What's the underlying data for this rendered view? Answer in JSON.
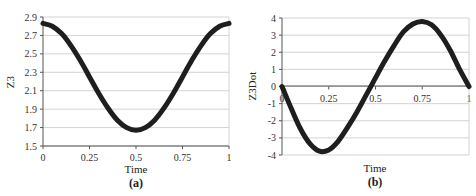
{
  "chart_data": [
    {
      "type": "line",
      "panel_label": "(a)",
      "title": "",
      "xlabel": "Time",
      "ylabel": "Z3",
      "xlim": [
        0,
        1
      ],
      "ylim": [
        1.5,
        2.9
      ],
      "x_ticks": [
        "0",
        "0.25",
        "0.5",
        "0.75",
        "1"
      ],
      "y_ticks": [
        "2.9",
        "2.7",
        "2.5",
        "2.3",
        "2.1",
        "1.9",
        "1.7",
        "1.5"
      ],
      "grid": true,
      "legend": null,
      "series": [
        {
          "name": "Z3",
          "x": [
            0,
            0.05,
            0.1,
            0.15,
            0.2,
            0.25,
            0.3,
            0.35,
            0.4,
            0.45,
            0.5,
            0.55,
            0.6,
            0.65,
            0.7,
            0.75,
            0.8,
            0.85,
            0.9,
            0.95,
            1.0
          ],
          "values": [
            2.83,
            2.8,
            2.72,
            2.59,
            2.43,
            2.25,
            2.07,
            1.91,
            1.78,
            1.7,
            1.67,
            1.7,
            1.78,
            1.91,
            2.07,
            2.25,
            2.43,
            2.59,
            2.72,
            2.8,
            2.83
          ]
        }
      ]
    },
    {
      "type": "line",
      "panel_label": "(b)",
      "title": "",
      "xlabel": "Time",
      "ylabel": "Z3Dot",
      "xlim": [
        0,
        1
      ],
      "ylim": [
        -4,
        4
      ],
      "x_ticks": [
        "0",
        "0.25",
        "0.5",
        "0.75",
        "1"
      ],
      "y_ticks": [
        "4",
        "3",
        "2",
        "1",
        "0",
        "-1",
        "-2",
        "-3",
        "-4"
      ],
      "grid": true,
      "legend": null,
      "series": [
        {
          "name": "Z3Dot",
          "x": [
            0,
            0.05,
            0.1,
            0.15,
            0.2,
            0.25,
            0.3,
            0.35,
            0.4,
            0.45,
            0.5,
            0.55,
            0.6,
            0.65,
            0.7,
            0.75,
            0.8,
            0.85,
            0.9,
            0.95,
            1.0
          ],
          "values": [
            0,
            -1.3,
            -2.5,
            -3.35,
            -3.78,
            -3.7,
            -3.2,
            -2.4,
            -1.5,
            -0.5,
            0.5,
            1.5,
            2.4,
            3.2,
            3.65,
            3.8,
            3.6,
            3.0,
            2.1,
            1.0,
            0
          ]
        }
      ]
    }
  ]
}
